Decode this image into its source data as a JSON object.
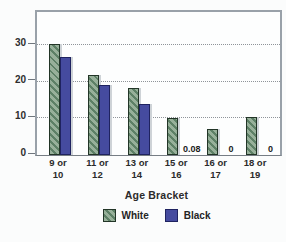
{
  "chart_data": {
    "type": "bar",
    "title": "",
    "xlabel": "Age Bracket",
    "ylabel": "",
    "categories": [
      [
        "9 or",
        "10"
      ],
      [
        "11 or",
        "12"
      ],
      [
        "13 or",
        "14"
      ],
      [
        "15 or",
        "16"
      ],
      [
        "16 or",
        "17"
      ],
      [
        "18 or",
        "19"
      ]
    ],
    "series": [
      {
        "name": "White",
        "color": "#97b09a",
        "hatch": true,
        "values": [
          30.4,
          21.7,
          18.3,
          10.0,
          7.1,
          10.4
        ],
        "baseline_labels": [
          "",
          "",
          "",
          "",
          "",
          ""
        ]
      },
      {
        "name": "Black",
        "color": "#454b9f",
        "hatch": false,
        "values": [
          26.7,
          19.0,
          14.0,
          0.08,
          0,
          0
        ],
        "baseline_labels": [
          "",
          "",
          "",
          "0.08",
          "0",
          "0"
        ]
      }
    ],
    "yticks": [
      0,
      10,
      20,
      30
    ],
    "ylim": [
      0,
      39
    ],
    "grid": "horizontal-dotted",
    "legend_position": "bottom"
  },
  "legend": {
    "items": [
      {
        "label": "White",
        "swatch": "green-hatched"
      },
      {
        "label": "Black",
        "swatch": "blue-solid"
      }
    ]
  },
  "colors": {
    "white_series_fill": "#97b09a",
    "white_series_hatch": "#5d8066",
    "black_series_fill": "#454b9f",
    "frame_border": "#99a1a9",
    "gridline": "#8f9499",
    "text": "#2b2b2b",
    "background": "#fbfcfc"
  }
}
